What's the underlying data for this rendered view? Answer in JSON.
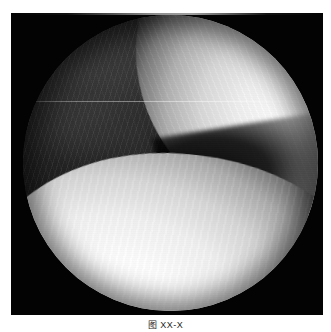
{
  "page": {
    "background_color": "#ffffff",
    "width": 331,
    "height": 332
  },
  "figure": {
    "name": "arthroscopic-knee-image",
    "modality": "arthroscopy",
    "plate": {
      "background_color": "#030303",
      "x": 11,
      "y": 13,
      "width": 312,
      "height": 302
    },
    "field_of_view": {
      "shape": "circle",
      "x": 12,
      "y": 2,
      "width": 295,
      "height": 296,
      "alt_text": "Circular endoscopic field of view of a knee joint"
    },
    "regions": [
      {
        "name": "dark-joint-space",
        "label": "intercondylar notch / soft tissue",
        "tone": "dark",
        "color": "#1a1a1a",
        "position": "upper-left to center"
      },
      {
        "name": "upper-cartilage",
        "label": "femoral condyle articular cartilage",
        "tone": "bright",
        "color": "#f4f4f4",
        "position": "upper-right"
      },
      {
        "name": "lower-cartilage",
        "label": "opposing articular surface",
        "tone": "bright",
        "color": "#ffffff",
        "position": "lower"
      },
      {
        "name": "notch-wedge",
        "label": "dark recess between articular surfaces",
        "tone": "black",
        "color": "#000000",
        "position": "mid-right"
      }
    ],
    "artifacts": [
      {
        "name": "scan-line",
        "label": "horizontal interlace scan line",
        "y": 86
      },
      {
        "name": "striations",
        "label": "diagonal fibre striation texture"
      }
    ],
    "caption": "图 XX-X"
  }
}
